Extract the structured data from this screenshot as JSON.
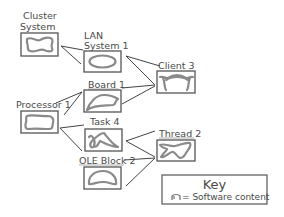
{
  "diagram": {
    "nodes": [
      {
        "id": "cluster-system",
        "label_lines": [
          "Cluster",
          "System"
        ],
        "shape": "wave-blob"
      },
      {
        "id": "lan-system-1",
        "label_lines": [
          "LAN",
          "System 1"
        ],
        "shape": "ellipse"
      },
      {
        "id": "client-3",
        "label_lines": [
          "Client 3"
        ],
        "shape": "arch"
      },
      {
        "id": "board-1",
        "label_lines": [
          "Board 1"
        ],
        "shape": "leaf"
      },
      {
        "id": "processor-1",
        "label_lines": [
          "Processor 1"
        ],
        "shape": "rounded-blob"
      },
      {
        "id": "task-4",
        "label_lines": [
          "Task 4"
        ],
        "shape": "scribble"
      },
      {
        "id": "thread-2",
        "label_lines": [
          "Thread 2"
        ],
        "shape": "bone"
      },
      {
        "id": "ole-block-2",
        "label_lines": [
          "OLE Block 2"
        ],
        "shape": "kidney"
      }
    ],
    "edges": [
      {
        "from": "cluster-system",
        "to": "lan-system-1"
      },
      {
        "from": "lan-system-1",
        "to": "client-3"
      },
      {
        "from": "board-1",
        "to": "client-3"
      },
      {
        "from": "processor-1",
        "to": "board-1"
      },
      {
        "from": "processor-1",
        "to": "task-4"
      },
      {
        "from": "processor-1",
        "to": "ole-block-2"
      },
      {
        "from": "task-4",
        "to": "thread-2"
      },
      {
        "from": "ole-block-2",
        "to": "thread-2"
      }
    ]
  },
  "labels": {
    "cluster_1": "Cluster",
    "cluster_2": "System",
    "lan_1": "LAN",
    "lan_2": "System 1",
    "client": "Client 3",
    "board": "Board 1",
    "processor": "Processor 1",
    "task": "Task 4",
    "thread": "Thread 2",
    "ole": "OLE Block 2"
  },
  "key": {
    "title": "Key",
    "icon": "software-content-glyph",
    "symbol_text": "= Software content"
  },
  "colors": {
    "box_stroke": "#555555",
    "shape_stroke": "#8a8a8a",
    "text": "#4a4a4a",
    "background": "#ffffff"
  }
}
